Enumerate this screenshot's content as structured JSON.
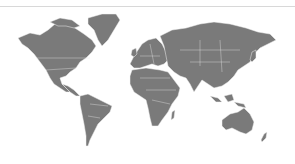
{
  "map": {
    "type": "world-silhouette",
    "land_color": "#7a7a7a",
    "border_color": "#e6e6e6",
    "background_color": "#ffffff",
    "rule_color": "#d8d8d8",
    "regions": [
      "North America",
      "Greenland",
      "South America",
      "Europe",
      "Africa",
      "Asia",
      "Australia",
      "New Zealand"
    ]
  }
}
